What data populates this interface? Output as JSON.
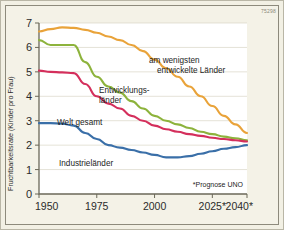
{
  "figure": {
    "code_badge": "75298",
    "footnote": "*Prognose UNO"
  },
  "chart_data": {
    "type": "line",
    "title": "",
    "xlabel": "",
    "ylabel": "Fruchtbarkeitsrate (Kinder pro Frau)",
    "xlim": [
      1950,
      2040
    ],
    "ylim": [
      0,
      7
    ],
    "grid": true,
    "legend_position": "inline-annotations",
    "x_ticks": [
      1950,
      1975,
      2000,
      2025,
      2040
    ],
    "x_tick_labels": [
      "1950",
      "1975",
      "2000",
      "2025*",
      "2040*"
    ],
    "y_ticks": [
      0,
      1,
      2,
      3,
      4,
      5,
      6,
      7
    ],
    "y_tick_labels": [
      "0",
      "1",
      "2",
      "3",
      "4",
      "5",
      "6",
      "7"
    ],
    "series": [
      {
        "name": "am wenigsten entwickelte Länder",
        "label": "am wenigsten\nentwickelte Länder",
        "color": "#e9a33a",
        "x": [
          1950,
          1955,
          1960,
          1965,
          1970,
          1975,
          1980,
          1985,
          1990,
          1995,
          2000,
          2005,
          2010,
          2015,
          2020,
          2025,
          2030,
          2035,
          2040
        ],
        "values": [
          6.65,
          6.75,
          6.82,
          6.8,
          6.72,
          6.6,
          6.45,
          6.3,
          6.1,
          5.85,
          5.5,
          5.15,
          4.8,
          4.4,
          4.0,
          3.6,
          3.2,
          2.85,
          2.5
        ]
      },
      {
        "name": "Entwicklungsländer",
        "label": "Entwicklungs-\nländer",
        "color": "#8db33c",
        "x": [
          1950,
          1955,
          1960,
          1965,
          1970,
          1975,
          1980,
          1985,
          1990,
          1995,
          2000,
          2005,
          2010,
          2015,
          2020,
          2025,
          2030,
          2035,
          2040
        ],
        "values": [
          6.3,
          6.1,
          6.1,
          6.1,
          5.4,
          4.8,
          4.4,
          4.15,
          3.8,
          3.5,
          3.2,
          3.0,
          2.85,
          2.7,
          2.55,
          2.45,
          2.35,
          2.28,
          2.2
        ]
      },
      {
        "name": "Welt gesamt",
        "label": "Welt gesamt",
        "color": "#d42f5c",
        "x": [
          1950,
          1955,
          1960,
          1965,
          1970,
          1975,
          1980,
          1985,
          1990,
          1995,
          2000,
          2005,
          2010,
          2015,
          2020,
          2025,
          2030,
          2035,
          2040
        ],
        "values": [
          5.05,
          5.0,
          4.98,
          4.95,
          4.5,
          4.0,
          3.7,
          3.5,
          3.2,
          3.0,
          2.8,
          2.65,
          2.55,
          2.45,
          2.38,
          2.3,
          2.25,
          2.2,
          2.15
        ]
      },
      {
        "name": "Industrieländer",
        "label": "Industrieländer",
        "color": "#3a6fa8",
        "x": [
          1950,
          1955,
          1960,
          1965,
          1970,
          1975,
          1980,
          1985,
          1990,
          1995,
          2000,
          2005,
          2010,
          2015,
          2020,
          2025,
          2030,
          2035,
          2040
        ],
        "values": [
          2.9,
          2.9,
          2.88,
          2.8,
          2.5,
          2.25,
          2.0,
          1.9,
          1.8,
          1.7,
          1.6,
          1.5,
          1.5,
          1.55,
          1.65,
          1.75,
          1.85,
          1.92,
          2.0
        ]
      }
    ],
    "annotations": [
      {
        "id": "ann-least-developed",
        "text_line1": "am wenigsten",
        "text_line2": "entwickelte Länder"
      },
      {
        "id": "ann-developing",
        "text_line1": "Entwicklungs-",
        "text_line2": "länder"
      },
      {
        "id": "ann-world",
        "text_line1": "Welt gesamt",
        "text_line2": ""
      },
      {
        "id": "ann-industrial",
        "text_line1": "Industrieländer",
        "text_line2": ""
      }
    ]
  }
}
